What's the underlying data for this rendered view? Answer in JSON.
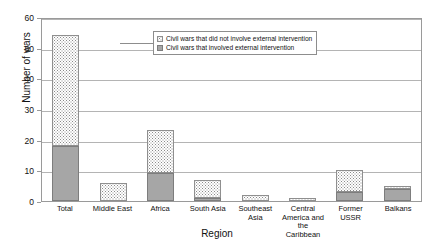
{
  "chart_data": {
    "type": "bar",
    "stacked": true,
    "title": "",
    "xlabel": "Region",
    "ylabel": "Number of wars",
    "ylim": [
      0,
      60
    ],
    "yticks": [
      0,
      10,
      20,
      30,
      40,
      50,
      60
    ],
    "grid": true,
    "legend_position": "inside-top-center",
    "categories": [
      "Total",
      "Middle East",
      "Africa",
      "South Asia",
      "Southeast Asia",
      "Central America and the Caribbean",
      "Former USSR",
      "Balkans"
    ],
    "series": [
      {
        "name": "Civil wars that involved external intervention",
        "fill": "solid-gray",
        "values": [
          18,
          0,
          9,
          1,
          0,
          0,
          3,
          4
        ]
      },
      {
        "name": "Civil wars that did not involve external intervention",
        "fill": "dotted",
        "values": [
          36,
          6,
          14,
          6,
          2,
          1,
          7,
          1
        ]
      }
    ],
    "totals": [
      54,
      6,
      23,
      7,
      2,
      1,
      10,
      5
    ]
  },
  "legend": {
    "entries": [
      {
        "label": "Civil wars that did not involve external intervention"
      },
      {
        "label": "Civil wars that involved external intervention"
      }
    ]
  },
  "axes": {
    "y_title": "Number of wars",
    "x_title": "Region",
    "y_tick_labels": [
      "0",
      "10",
      "20",
      "30",
      "40",
      "50",
      "60"
    ]
  },
  "colors": {
    "solid_fill": "#a6a6a6",
    "dotted_fill": "#ffffff",
    "dot_color": "#8a8a8a",
    "border": "#8f8f8f",
    "gridline": "#b4b4b4",
    "axis": "#9a9a9a",
    "text": "#111111"
  }
}
